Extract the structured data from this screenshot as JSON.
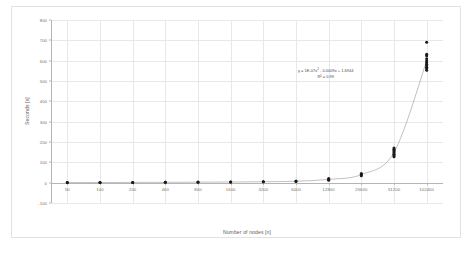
{
  "chart_data": {
    "type": "scatter",
    "title": "",
    "xlabel": "Number of nodes [n]",
    "ylabel": "Seconds [s]",
    "grid": true,
    "legend": false,
    "xtype": "category",
    "categories": [
      "50",
      "100",
      "200",
      "400",
      "800",
      "1600",
      "3200",
      "6400",
      "12800",
      "25600",
      "51200",
      "102400"
    ],
    "ylim": [
      -100,
      800
    ],
    "yticks": [
      -100,
      0,
      100,
      200,
      300,
      400,
      500,
      600,
      700,
      800
    ],
    "ytick_labels": [
      "-100",
      "0",
      "100",
      "200",
      "300",
      "400",
      "500",
      "600",
      "700",
      "800"
    ],
    "series": [
      {
        "name": "Measurements",
        "marker": "circle",
        "color": "#1a1a1a",
        "points": [
          {
            "xi": 0,
            "x": 50,
            "y": 0.3
          },
          {
            "xi": 0,
            "x": 50,
            "y": 0.5
          },
          {
            "xi": 1,
            "x": 100,
            "y": 0.6
          },
          {
            "xi": 1,
            "x": 100,
            "y": 0.9
          },
          {
            "xi": 2,
            "x": 200,
            "y": 1.0
          },
          {
            "xi": 2,
            "x": 200,
            "y": 1.4
          },
          {
            "xi": 3,
            "x": 400,
            "y": 1.6
          },
          {
            "xi": 3,
            "x": 400,
            "y": 2.0
          },
          {
            "xi": 4,
            "x": 800,
            "y": 2.2
          },
          {
            "xi": 4,
            "x": 800,
            "y": 2.8
          },
          {
            "xi": 5,
            "x": 1600,
            "y": 3.0
          },
          {
            "xi": 5,
            "x": 1600,
            "y": 3.6
          },
          {
            "xi": 6,
            "x": 3200,
            "y": 4.0
          },
          {
            "xi": 6,
            "x": 3200,
            "y": 5.0
          },
          {
            "xi": 7,
            "x": 6400,
            "y": 6.0
          },
          {
            "xi": 7,
            "x": 6400,
            "y": 8.0
          },
          {
            "xi": 8,
            "x": 12800,
            "y": 12.0
          },
          {
            "xi": 8,
            "x": 12800,
            "y": 16.0
          },
          {
            "xi": 8,
            "x": 12800,
            "y": 20.0
          },
          {
            "xi": 9,
            "x": 25600,
            "y": 34.0
          },
          {
            "xi": 9,
            "x": 25600,
            "y": 40.0
          },
          {
            "xi": 9,
            "x": 25600,
            "y": 45.0
          },
          {
            "xi": 10,
            "x": 51200,
            "y": 128.0
          },
          {
            "xi": 10,
            "x": 51200,
            "y": 134.0
          },
          {
            "xi": 10,
            "x": 51200,
            "y": 140.0
          },
          {
            "xi": 10,
            "x": 51200,
            "y": 146.0
          },
          {
            "xi": 10,
            "x": 51200,
            "y": 152.0
          },
          {
            "xi": 10,
            "x": 51200,
            "y": 158.0
          },
          {
            "xi": 10,
            "x": 51200,
            "y": 164.0
          },
          {
            "xi": 10,
            "x": 51200,
            "y": 170.0
          },
          {
            "xi": 11,
            "x": 102400,
            "y": 553.0
          },
          {
            "xi": 11,
            "x": 102400,
            "y": 561.0
          },
          {
            "xi": 11,
            "x": 102400,
            "y": 568.0
          },
          {
            "xi": 11,
            "x": 102400,
            "y": 575.0
          },
          {
            "xi": 11,
            "x": 102400,
            "y": 582.0
          },
          {
            "xi": 11,
            "x": 102400,
            "y": 590.0
          },
          {
            "xi": 11,
            "x": 102400,
            "y": 598.0
          },
          {
            "xi": 11,
            "x": 102400,
            "y": 610.0
          },
          {
            "xi": 11,
            "x": 102400,
            "y": 624.0
          },
          {
            "xi": 11,
            "x": 102400,
            "y": 632.0
          },
          {
            "xi": 11,
            "x": 102400,
            "y": 690.0
          }
        ]
      }
    ],
    "trendline": {
      "type": "polynomial",
      "order": 2,
      "color": "#a6a6a6",
      "equation": "y = 1E-07x² - 0.0009x + 1.6944",
      "equation_parts": {
        "lead": "y = 1E-07x",
        "exp": "2",
        "tail": " - 0.0009x + 1.6944"
      },
      "r_squared_label": "R² = 0.99",
      "r_squared": 0.99,
      "coefficients": {
        "a": 1e-07,
        "b": -0.0009,
        "c": 1.6944
      }
    },
    "colors": {
      "marker": "#1a1a1a",
      "trendline": "#a6a6a6",
      "gridline": "#e8e8e8",
      "axis": "#b5b5b5",
      "tick_text": "#6f6f6f",
      "title_text": "#5a5a5a",
      "border": "#e2e2e2",
      "background": "#ffffff"
    }
  }
}
